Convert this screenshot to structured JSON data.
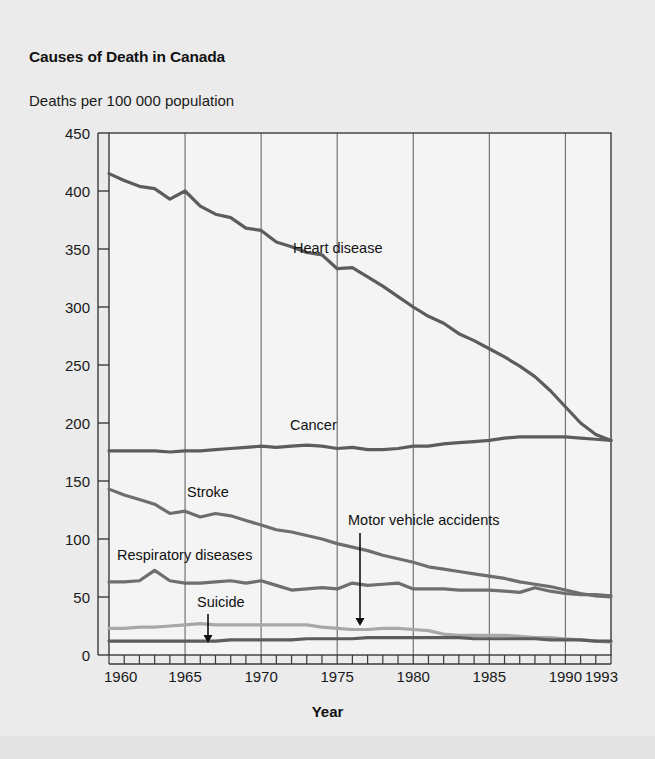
{
  "figure": {
    "title": "Causes of Death in Canada",
    "y_axis_title": "Deaths per 100 000 population",
    "x_axis_title": "Year"
  },
  "axes": {
    "y_ticks": [
      "0",
      "50",
      "100",
      "150",
      "200",
      "250",
      "300",
      "350",
      "400",
      "450"
    ],
    "x_ticks": [
      "1960",
      "1965",
      "1970",
      "1975",
      "1980",
      "1985",
      "1990",
      "1993"
    ]
  },
  "annotations": {
    "heart_disease": "Heart disease",
    "cancer": "Cancer",
    "stroke": "Stroke",
    "respiratory": "Respiratory diseases",
    "motor_vehicle": "Motor vehicle accidents",
    "suicide": "Suicide"
  },
  "colors": {
    "background": "#ebebeb",
    "plot_background": "#f4f4f4",
    "axis": "#3a3a3a",
    "gridline": "#5a5a5a",
    "series_dark": "#5c5c5c",
    "series_mid": "#6e6e6e",
    "series_light": "#a8a8a8",
    "text": "#1a1a1a"
  },
  "chart_data": {
    "type": "line",
    "title": "Causes of Death in Canada",
    "subtitle": "Deaths per 100 000 population",
    "xlabel": "Year",
    "ylabel": "Deaths per 100 000 population",
    "xlim": [
      1960,
      1993
    ],
    "ylim": [
      0,
      450
    ],
    "ytick_step": 50,
    "grid": "vertical gridlines every 5 years",
    "legend": "inline labels on plot",
    "x": [
      1960,
      1961,
      1962,
      1963,
      1964,
      1965,
      1966,
      1967,
      1968,
      1969,
      1970,
      1971,
      1972,
      1973,
      1974,
      1975,
      1976,
      1977,
      1978,
      1979,
      1980,
      1981,
      1982,
      1983,
      1984,
      1985,
      1986,
      1987,
      1988,
      1989,
      1990,
      1991,
      1992,
      1993
    ],
    "series": [
      {
        "name": "Heart disease",
        "color": "#5c5c5c",
        "values": [
          415,
          409,
          404,
          402,
          393,
          400,
          387,
          380,
          377,
          368,
          366,
          356,
          352,
          347,
          345,
          333,
          334,
          326,
          318,
          309,
          300,
          292,
          286,
          277,
          271,
          264,
          257,
          249,
          240,
          228,
          214,
          200,
          190,
          185
        ]
      },
      {
        "name": "Cancer",
        "color": "#5c5c5c",
        "values": [
          176,
          176,
          176,
          176,
          175,
          176,
          176,
          177,
          178,
          179,
          180,
          179,
          180,
          181,
          180,
          178,
          179,
          177,
          177,
          178,
          180,
          180,
          182,
          183,
          184,
          185,
          187,
          188,
          188,
          188,
          188,
          187,
          186,
          185
        ]
      },
      {
        "name": "Stroke",
        "color": "#6e6e6e",
        "values": [
          143,
          138,
          134,
          130,
          122,
          124,
          119,
          122,
          120,
          116,
          112,
          108,
          106,
          103,
          100,
          96,
          93,
          90,
          86,
          83,
          80,
          76,
          74,
          72,
          70,
          68,
          66,
          63,
          61,
          59,
          56,
          53,
          51,
          50
        ]
      },
      {
        "name": "Respiratory diseases",
        "color": "#6e6e6e",
        "values": [
          63,
          63,
          64,
          73,
          64,
          62,
          62,
          63,
          64,
          62,
          64,
          60,
          56,
          57,
          58,
          57,
          62,
          60,
          61,
          62,
          57,
          57,
          57,
          56,
          56,
          56,
          55,
          54,
          58,
          55,
          53,
          52,
          52,
          51
        ]
      },
      {
        "name": "Motor vehicle accidents",
        "color": "#a8a8a8",
        "values": [
          23,
          23,
          24,
          24,
          25,
          26,
          27,
          26,
          26,
          26,
          26,
          26,
          26,
          26,
          24,
          23,
          22,
          22,
          23,
          23,
          22,
          21,
          18,
          17,
          17,
          17,
          17,
          16,
          15,
          15,
          14,
          13,
          12,
          11
        ]
      },
      {
        "name": "Suicide",
        "color": "#5c5c5c",
        "values": [
          12,
          12,
          12,
          12,
          12,
          12,
          12,
          12,
          13,
          13,
          13,
          13,
          13,
          14,
          14,
          14,
          14,
          15,
          15,
          15,
          15,
          15,
          15,
          15,
          14,
          14,
          14,
          14,
          14,
          13,
          13,
          13,
          12,
          12
        ]
      }
    ],
    "pointer_annotations": [
      {
        "label": "Motor vehicle accidents",
        "points_to_series": "Motor vehicle accidents",
        "at_year": 1977
      },
      {
        "label": "Suicide",
        "points_to_series": "Suicide",
        "at_year": 1966
      }
    ]
  }
}
